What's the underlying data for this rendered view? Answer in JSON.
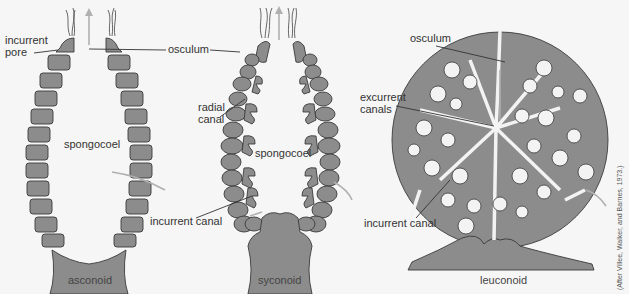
{
  "figure": {
    "panels": [
      {
        "id": "asconoid",
        "caption": "asconoid",
        "labels": {
          "incurrent_pore": [
            "incurrent",
            "pore"
          ],
          "osculum": "osculum",
          "spongocoel": "spongocoel"
        }
      },
      {
        "id": "syconoid",
        "caption": "syconoid",
        "labels": {
          "radial_canal": [
            "radial",
            "canal"
          ],
          "spongocoel": "spongocoel",
          "incurrent_canal": "incurrent canal"
        }
      },
      {
        "id": "leuconoid",
        "caption": "leuconoid",
        "labels": {
          "osculum": "osculum",
          "excurrent_canals": [
            "excurrent",
            "canals"
          ],
          "incurrent_canal": "incurrent canal"
        }
      }
    ],
    "credit": "(After Villee, Walker, and Barnes, 1973.)",
    "colors": {
      "tissue": "#8c8c8c",
      "outline": "#3a3a3a",
      "background": "#f6f6f6",
      "flow_arrow": "#b0b0b0"
    }
  }
}
